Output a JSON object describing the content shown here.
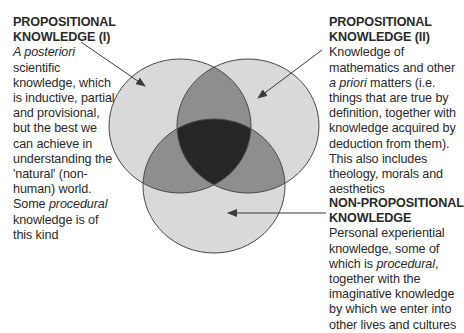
{
  "diagram": {
    "type": "venn",
    "colors": {
      "single_region": "#d9d9d9",
      "double_overlap": "#8e8e8e",
      "triple_overlap": "#262626",
      "outline": "#4a4a4a",
      "arrow": "#3a3a3a",
      "text": "#2a2a2a"
    },
    "circles": [
      {
        "id": "propositional-i",
        "cx": 180,
        "cy": 126,
        "rx": 71,
        "ry": 67
      },
      {
        "id": "propositional-ii",
        "cx": 248,
        "cy": 126,
        "rx": 71,
        "ry": 67
      },
      {
        "id": "non-propositional",
        "cx": 214,
        "cy": 186,
        "rx": 71,
        "ry": 67
      }
    ]
  },
  "labels": {
    "left": {
      "heading": [
        "PROPOSITIONAL",
        "KNOWLEDGE (I)"
      ],
      "body": [
        {
          "text": "A posteriori",
          "italic": true
        },
        {
          "text": "scientific"
        },
        {
          "text": "knowledge, which"
        },
        {
          "text": "is inductive, partial"
        },
        {
          "text": "and provisional,"
        },
        {
          "text": "but the best we"
        },
        {
          "text": "can achieve in"
        },
        {
          "text": "understanding the"
        },
        {
          "text": "'natural' (non-"
        },
        {
          "text": "human) world."
        },
        {
          "pre": "Some ",
          "italic_part": "procedural"
        },
        {
          "text": "knowledge is of"
        },
        {
          "text": "this kind"
        }
      ]
    },
    "right": {
      "heading": [
        "PROPOSITIONAL",
        "KNOWLEDGE (II)"
      ],
      "body": [
        {
          "text": "Knowledge of"
        },
        {
          "text": "mathematics and other"
        },
        {
          "italic_part": "a priori",
          "post": " matters (i.e."
        },
        {
          "text": "things that are true by"
        },
        {
          "text": "definition, together with"
        },
        {
          "text": "knowledge acquired by"
        },
        {
          "text": "deduction from them)."
        },
        {
          "text": "This also includes"
        },
        {
          "text": "theology, morals and"
        },
        {
          "text": "aesthetics"
        }
      ]
    },
    "bottom": {
      "heading": [
        "NON-PROPOSITIONAL",
        "KNOWLEDGE"
      ],
      "body": [
        {
          "text": "Personal experiential"
        },
        {
          "text": "knowledge, some of"
        },
        {
          "pre": "which is ",
          "italic_part": "procedural",
          "post": ","
        },
        {
          "text": "together with the"
        },
        {
          "text": "imaginative knowledge"
        },
        {
          "text": "by which we enter into"
        },
        {
          "text": "other lives and cultures"
        }
      ]
    }
  }
}
